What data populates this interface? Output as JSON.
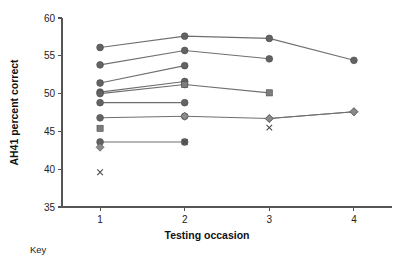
{
  "chart_data": {
    "type": "line",
    "title": "",
    "xlabel": "Testing occasion",
    "ylabel": "AH41 percent correct",
    "xlim": [
      0.55,
      4.45
    ],
    "ylim": [
      35,
      60
    ],
    "x_ticks": [
      1,
      2,
      3,
      4
    ],
    "x_tick_labels": [
      "1",
      "2",
      "3",
      "4"
    ],
    "y_ticks": [
      35,
      40,
      45,
      50,
      55,
      60
    ],
    "y_tick_labels": [
      "35",
      "40",
      "45",
      "50",
      "55",
      "60"
    ],
    "grid": false,
    "legend_position": "none",
    "line_color": "#6f6f6f",
    "marker_colors": {
      "circle": "#636363",
      "square": "#7d7d7d",
      "diamond": "#8a8a8a",
      "cross": "#4a4a4a"
    },
    "series": [
      {
        "name": "series-1",
        "marker": "circle",
        "x": [
          1,
          2,
          3,
          4
        ],
        "values": [
          56.1,
          57.6,
          57.3,
          54.4
        ]
      },
      {
        "name": "series-2",
        "marker": "circle",
        "x": [
          1,
          2,
          3
        ],
        "values": [
          53.8,
          55.7,
          54.6
        ]
      },
      {
        "name": "series-3",
        "marker": "circle",
        "x": [
          1,
          2
        ],
        "values": [
          51.4,
          53.7
        ]
      },
      {
        "name": "series-4",
        "marker": "circle",
        "x": [
          1,
          2
        ],
        "values": [
          50.2,
          51.6
        ]
      },
      {
        "name": "series-5",
        "marker": "circle",
        "x": [
          1,
          2
        ],
        "values": [
          50.0,
          51.2
        ]
      },
      {
        "name": "series-6",
        "marker": "circle",
        "x": [
          1,
          2
        ],
        "values": [
          48.8,
          48.8
        ]
      },
      {
        "name": "series-7",
        "marker": "circle",
        "x": [
          1,
          2
        ],
        "values": [
          46.8,
          47.0
        ]
      },
      {
        "name": "series-8",
        "marker": "circle",
        "x": [
          1,
          2
        ],
        "values": [
          43.6,
          43.6
        ]
      },
      {
        "name": "series-9",
        "marker": "square",
        "x": [
          2,
          3
        ],
        "values": [
          51.2,
          50.1
        ]
      },
      {
        "name": "series-10",
        "marker": "diamond",
        "x": [
          2,
          3,
          4
        ],
        "values": [
          47.0,
          46.7,
          47.6
        ]
      },
      {
        "name": "series-11",
        "marker": "diamond",
        "x": [
          3,
          4
        ],
        "values": [
          46.7,
          47.6
        ]
      }
    ],
    "extra_points": [
      {
        "name": "point-square-45",
        "marker": "square",
        "x": 1,
        "value": 45.4
      },
      {
        "name": "point-diamond-43",
        "marker": "diamond",
        "x": 1,
        "value": 42.9
      },
      {
        "name": "point-cross-40",
        "marker": "cross",
        "x": 1,
        "value": 39.6
      },
      {
        "name": "point-cross-44",
        "marker": "cross",
        "x": 2,
        "value": 43.6
      },
      {
        "name": "point-cross-45",
        "marker": "cross",
        "x": 3,
        "value": 45.5
      }
    ]
  },
  "key": {
    "label": "Key"
  }
}
